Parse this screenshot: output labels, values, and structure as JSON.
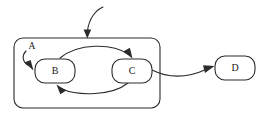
{
  "diagram": {
    "type": "state-machine",
    "title": "",
    "background_color": "#ffffff",
    "stroke_color": "#2b2b2b",
    "fill_color": "#ffffff",
    "region": {
      "id": "A",
      "label": "A",
      "shape": "rounded-rectangle",
      "x": 14,
      "y": 38,
      "width": 146,
      "height": 70,
      "corner_radius": 9,
      "label_x": 32,
      "label_y": 47,
      "contains": [
        "B",
        "C"
      ]
    },
    "nodes": [
      {
        "id": "B",
        "label": "B",
        "shape": "rounded-rectangle",
        "x": 35,
        "y": 59,
        "width": 40,
        "height": 24,
        "corner_radius": 10,
        "inside_region": "A"
      },
      {
        "id": "C",
        "label": "C",
        "shape": "rounded-rectangle",
        "x": 112,
        "y": 59,
        "width": 40,
        "height": 24,
        "corner_radius": 10,
        "inside_region": "A"
      },
      {
        "id": "D",
        "label": "D",
        "shape": "rounded-rectangle",
        "x": 215,
        "y": 56,
        "width": 40,
        "height": 24,
        "corner_radius": 10,
        "inside_region": null
      }
    ],
    "edges": [
      {
        "id": "entry-to-region-a",
        "from": null,
        "to": "A",
        "label": "",
        "kind": "external-entry",
        "path": "M 103 7 C 96 10, 89 18, 87.5 31",
        "arrow": "M 87.3 38.5 L 83.6 29.5 L 91.2 29.5 Z"
      },
      {
        "id": "initial-to-b",
        "from": "A",
        "to": "B",
        "label": "",
        "kind": "initial",
        "path": "M 26 51 C 22 55, 22 61, 27.5 65",
        "arrow": "M 33.5 70.5 L 24.3 62.6 L 30.6 59.9 Z"
      },
      {
        "id": "b-to-c",
        "from": "B",
        "to": "C",
        "label": "",
        "kind": "transition",
        "path": "M 60 58 C 78 43, 112 43, 128 54",
        "arrow": "M 132.5 58.5 L 123.3 51.6 L 129.9 47.8 Z"
      },
      {
        "id": "c-to-b",
        "from": "C",
        "to": "B",
        "label": "",
        "kind": "transition",
        "path": "M 128 83 C 112 96, 78 96, 62 89",
        "arrow": "M 56.5 84.5 L 66.3 90.5 L 60.3 94.3 Z"
      },
      {
        "id": "c-to-d",
        "from": "C",
        "to": "D",
        "label": "",
        "kind": "transition",
        "path": "M 152 70 C 172 80, 192 76, 207 69",
        "arrow": "M 214.5 66 L 205.0 73.0 L 203.0 65.3 Z"
      }
    ]
  }
}
